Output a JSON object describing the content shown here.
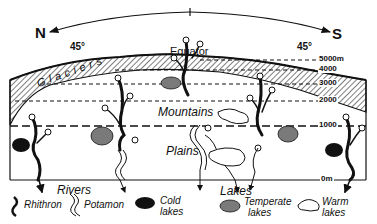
{
  "header": {
    "north": "N",
    "south": "S",
    "lat_left": "45°",
    "lat_right": "45°",
    "equator": "Equator"
  },
  "zones": {
    "glaciers": "Glaciers",
    "mountains": "Mountains",
    "plains": "Plains"
  },
  "altitudes": [
    "5000m",
    "4000",
    "3000",
    "2000",
    "1000",
    "0m"
  ],
  "legend": {
    "rivers_title": "Rivers",
    "rhithron": "Rhithron",
    "potamon": "Potamon",
    "lakes_title": "Lakes",
    "cold_lakes_1": "Cold",
    "cold_lakes_2": "lakes",
    "temperate_lakes_1": "Temperate",
    "temperate_lakes_2": "lakes",
    "warm_lakes_1": "Warm",
    "warm_lakes_2": "lakes"
  },
  "colors": {
    "ink": "#111111",
    "temperate_lake": "#7a7a7a",
    "cold_lake": "#111111",
    "background": "#ffffff"
  }
}
